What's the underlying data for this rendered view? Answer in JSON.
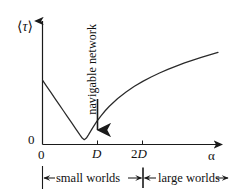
{
  "figure": {
    "background_color": "#ffffff",
    "ink_color": "#1a1a1a"
  },
  "axes": {
    "ylabel": "⟨τ⟩",
    "ylabel_bracket_open": "⟨",
    "ylabel_symbol": "τ",
    "ylabel_bracket_close": "⟩",
    "y_zero_tick": "0",
    "xlabel": "α",
    "xticks": [
      "0",
      "D",
      "2D"
    ],
    "xtick_2d_number": "2",
    "xtick_2d_symbol": "D"
  },
  "annotations": {
    "minimum_callout": "navigable network",
    "small_worlds": "small worlds",
    "large_worlds": "large worlds"
  },
  "chart_data": {
    "type": "line",
    "title": "",
    "xlabel": "α",
    "ylabel": "⟨τ⟩",
    "grid": false,
    "legend": "none",
    "xlim": [
      0,
      4.2
    ],
    "ylim": [
      0,
      1.05
    ],
    "xtick_values": [
      0,
      1,
      2
    ],
    "xtick_labels": [
      "0",
      "D",
      "2D"
    ],
    "ytick_values": [
      0
    ],
    "ytick_labels": [
      "0"
    ],
    "series": [
      {
        "name": "mean delivery time",
        "x": [
          0.0,
          0.1,
          0.2,
          0.3,
          0.4,
          0.5,
          0.6,
          0.7,
          0.8,
          0.9,
          0.95,
          1.0,
          1.05,
          1.1,
          1.2,
          1.3,
          1.4,
          1.5,
          1.6,
          1.8,
          2.0,
          2.2,
          2.4,
          2.6,
          2.8,
          3.0,
          3.2,
          3.4,
          3.6,
          3.8,
          4.0,
          4.2
        ],
        "y": [
          0.6,
          0.543,
          0.486,
          0.429,
          0.372,
          0.315,
          0.258,
          0.201,
          0.144,
          0.087,
          0.06,
          0.045,
          0.06,
          0.09,
          0.155,
          0.215,
          0.268,
          0.315,
          0.357,
          0.43,
          0.49,
          0.543,
          0.589,
          0.63,
          0.667,
          0.701,
          0.732,
          0.761,
          0.788,
          0.813,
          0.837,
          0.86
        ]
      }
    ],
    "minimum_point": {
      "x": 1.0,
      "y": 0.045,
      "label": "navigable network"
    },
    "regions": [
      {
        "label": "small worlds",
        "x_start": 0,
        "x_end": 2
      },
      {
        "label": "large worlds",
        "x_start": 2,
        "x_end": 4.2
      }
    ]
  }
}
